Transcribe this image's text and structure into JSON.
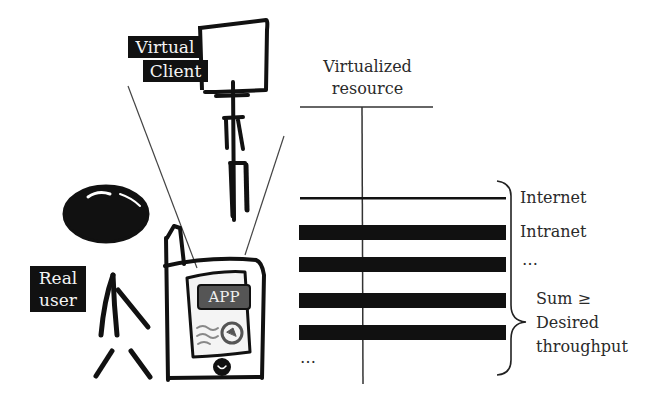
{
  "labels": {
    "virtual_client": [
      "Virtual",
      "Client"
    ],
    "real_user": [
      "Real",
      "user"
    ],
    "app": "APP",
    "virtualized_resource": [
      "Virtualized",
      "resource"
    ]
  },
  "resources": {
    "items": [
      "Internet",
      "Intranet",
      "…"
    ],
    "ellipsis_left": "…",
    "sum_label": [
      "Sum ≥",
      "Desired",
      "throughput"
    ]
  },
  "colors": {
    "ink": "#111111",
    "app_badge": "#555555",
    "background": "#ffffff"
  }
}
